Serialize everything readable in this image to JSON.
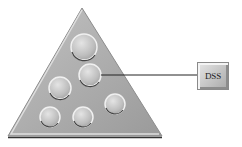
{
  "diagram": {
    "type": "pyramid-with-circles",
    "triangle": {
      "apex": [
        82,
        8
      ],
      "base_left": [
        8,
        136
      ],
      "base_right": [
        162,
        136
      ],
      "fill": "#a9a9a9"
    },
    "circles": [
      {
        "cx": 84,
        "cy": 47,
        "r": 13
      },
      {
        "cx": 90,
        "cy": 75,
        "r": 11
      },
      {
        "cx": 60,
        "cy": 88,
        "r": 11
      },
      {
        "cx": 115,
        "cy": 104,
        "r": 10
      },
      {
        "cx": 50,
        "cy": 117,
        "r": 10
      },
      {
        "cx": 83,
        "cy": 117,
        "r": 10
      }
    ],
    "connector": {
      "from": [
        101,
        75
      ],
      "to": [
        197,
        75
      ]
    },
    "box": {
      "label": "DSS"
    }
  }
}
